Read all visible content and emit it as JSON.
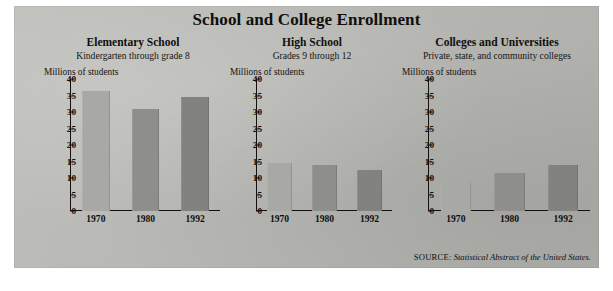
{
  "title": "School and College Enrollment",
  "source": {
    "label": "SOURCE:",
    "title": "Statistical Abstract of the United States."
  },
  "axis_caption": "Millions of students",
  "colors": {
    "background": "#b8b8b4",
    "bar_1970": "#a8a8a4",
    "bar_1980": "#8e8e8a",
    "bar_1992": "#82827e",
    "ink": "#121110"
  },
  "panels": [
    {
      "title": "Elementary School",
      "subtitle": "Kindergarten through grade 8",
      "axis_caption": "Millions of students"
    },
    {
      "title": "High School",
      "subtitle": "Grades 9 through 12",
      "axis_caption": "Millions of students"
    },
    {
      "title": "Colleges and Universities",
      "subtitle": "Private, state, and community colleges",
      "axis_caption": "Millions of students"
    }
  ],
  "chart_data": [
    {
      "type": "bar",
      "title": "Elementary School",
      "subtitle": "Kindergarten through grade 8",
      "categories": [
        "1970",
        "1980",
        "1992"
      ],
      "values": [
        36.5,
        31,
        34.5
      ],
      "xlabel": "",
      "ylabel": "Millions of students",
      "ylim": [
        0,
        40
      ],
      "yticks": [
        0,
        5,
        10,
        15,
        20,
        25,
        30,
        35,
        40
      ],
      "grid": false,
      "legend": "none"
    },
    {
      "type": "bar",
      "title": "High School",
      "subtitle": "Grades 9 through 12",
      "categories": [
        "1970",
        "1980",
        "1992"
      ],
      "values": [
        14.5,
        14,
        12.5
      ],
      "xlabel": "",
      "ylabel": "Millions of students",
      "ylim": [
        0,
        40
      ],
      "yticks": [
        0,
        5,
        10,
        15,
        20,
        25,
        30,
        35,
        40
      ],
      "grid": false,
      "legend": "none"
    },
    {
      "type": "bar",
      "title": "Colleges and Universities",
      "subtitle": "Private, state, and community colleges",
      "categories": [
        "1970",
        "1980",
        "1992"
      ],
      "values": [
        8.5,
        11.5,
        14
      ],
      "xlabel": "",
      "ylabel": "Millions of students",
      "ylim": [
        0,
        40
      ],
      "yticks": [
        0,
        5,
        10,
        15,
        20,
        25,
        30,
        35,
        40
      ],
      "grid": false,
      "legend": "none"
    }
  ]
}
